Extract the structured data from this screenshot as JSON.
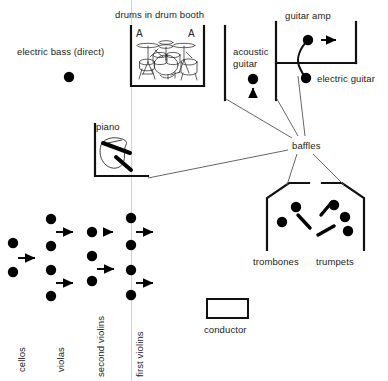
{
  "diagram": {
    "title_text": "drums in drum booth",
    "type": "recording-studio-layout",
    "labels": {
      "drum_booth": "drums in drum booth",
      "electric_bass": "electric bass (direct)",
      "piano": "piano",
      "acoustic_guitar_line1": "acoustic",
      "acoustic_guitar_line2": "guitar",
      "guitar_amp": "guitar amp",
      "electric_guitar": "electric guitar",
      "baffles": "baffles",
      "trombones": "trombones",
      "trumpets": "trumpets",
      "conductor": "conductor",
      "cellos": "cellos",
      "violas": "violas",
      "second_violins": "second violins",
      "first_violins": "first violins",
      "drum_mic_left": "A",
      "drum_mic_right": "A"
    },
    "colors": {
      "ink": "#1a1a1a",
      "wall": "#111111",
      "leader": "#555555",
      "faint_guide": "#cccccc",
      "background": "#ffffff"
    },
    "counts": {
      "cellos_mics": 1,
      "violas_mics": 2,
      "second_violins_mics": 3,
      "first_violins_mics": 3,
      "trombones_players": 2,
      "trumpets_players": 3,
      "drum_overheads": 2
    }
  }
}
